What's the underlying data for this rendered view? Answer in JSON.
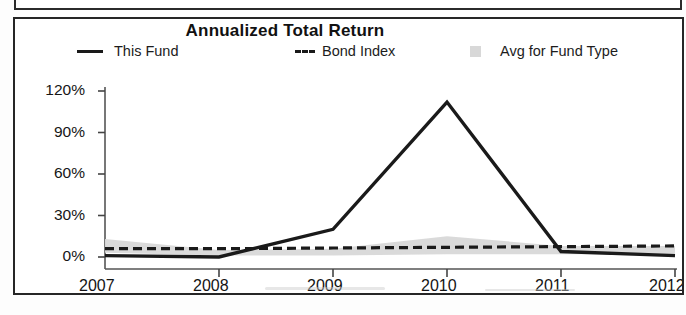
{
  "chart_data": {
    "type": "line",
    "title": "Annualized Total Return",
    "xlabel": "",
    "ylabel": "",
    "x": [
      "2007",
      "2008",
      "2009",
      "2010",
      "2011",
      "2012 YTD"
    ],
    "categories": [
      "2007",
      "2008",
      "2009",
      "2010",
      "2011",
      "2012 YTD"
    ],
    "ylim": [
      0,
      120
    ],
    "yticks": [
      0,
      30,
      60,
      90,
      120
    ],
    "ytick_labels": [
      "0%",
      "30%",
      "60%",
      "90%",
      "120%"
    ],
    "grid": false,
    "legend_position": "top",
    "series": [
      {
        "name": "This Fund",
        "style": "solid",
        "color": "#1a1a1a",
        "values": [
          1,
          0,
          20,
          112,
          4,
          1
        ]
      },
      {
        "name": "Bond Index",
        "style": "dashed",
        "color": "#1a1a1a",
        "values": [
          6,
          6,
          6.5,
          7,
          7.5,
          8
        ]
      },
      {
        "name": "Avg for Fund Type",
        "style": "area",
        "color": "#d8d8d8",
        "values": [
          13,
          5,
          6,
          15,
          8,
          8
        ],
        "lower": [
          3,
          1,
          1,
          2,
          2,
          2
        ]
      }
    ]
  },
  "chart": {
    "title": "Annualized Total Return",
    "legend": [
      {
        "label": "This Fund",
        "swatch": "solid-line-swatch"
      },
      {
        "label": "Bond Index",
        "swatch": "dashed-line-swatch"
      },
      {
        "label": "Avg for Fund Type",
        "swatch": "area-square-swatch"
      }
    ],
    "y_axis": {
      "labels": [
        "120%",
        "90%",
        "60%",
        "30%",
        "0%"
      ]
    },
    "x_axis": {
      "labels": [
        "2007",
        "2008",
        "2009",
        "2010",
        "2011",
        "2012"
      ],
      "suffix": "YTD"
    }
  },
  "colors": {
    "line": "#1a1a1a",
    "area": "#d8d8d8",
    "frame": "#262626",
    "text": "#141414"
  }
}
